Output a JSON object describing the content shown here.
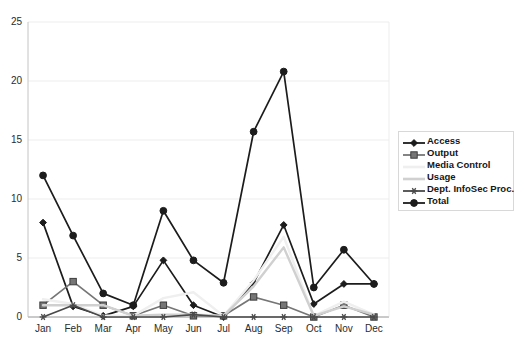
{
  "chart_data": {
    "type": "line",
    "title": "",
    "subtitle": "",
    "xlabel": "",
    "ylabel": "",
    "categories": [
      "Jan",
      "Feb",
      "Mar",
      "Apr",
      "May",
      "Jun",
      "Jul",
      "Aug",
      "Sep",
      "Oct",
      "Nov",
      "Dec"
    ],
    "ylim": [
      0,
      25
    ],
    "yticks": [
      0,
      5,
      10,
      15,
      20,
      25
    ],
    "ytick_labels": [
      "0",
      "5",
      "10",
      "15",
      "20",
      "25"
    ],
    "grid": true,
    "grid_axis": "y",
    "legend_position": "right",
    "series": [
      {
        "name": "Access",
        "color": "#1c1c1c",
        "marker": "diamond",
        "values": [
          8,
          0.9,
          0.1,
          0.9,
          4.8,
          1,
          0,
          2.9,
          7.8,
          1.1,
          2.8,
          2.8
        ]
      },
      {
        "name": "Output",
        "color": "#767676",
        "marker": "square",
        "values": [
          1,
          3,
          1,
          0.1,
          1,
          0.1,
          0.1,
          1.7,
          1,
          0,
          1,
          0
        ]
      },
      {
        "name": "Media Control",
        "color": "#efefef",
        "marker": "none",
        "values": [
          1.5,
          1.1,
          0.1,
          0.1,
          1.6,
          2.1,
          0.1,
          3.1,
          6.8,
          0.1,
          1.3,
          0.2
        ]
      },
      {
        "name": "Usage",
        "color": "#d0d0d0",
        "marker": "none",
        "values": [
          1,
          1,
          1,
          0.1,
          0.2,
          0.2,
          0.1,
          2.6,
          5.9,
          0.1,
          0.9,
          0.2
        ]
      },
      {
        "name": "Dept. InfoSec Proc.",
        "color": "#4a4a4a",
        "marker": "asterisk",
        "values": [
          0,
          1,
          0,
          0,
          0,
          0.2,
          0,
          0,
          0,
          0,
          0,
          0
        ]
      },
      {
        "name": "Total",
        "color": "#1c1c1c",
        "marker": "circle",
        "values": [
          12,
          6.9,
          2,
          1,
          9,
          4.8,
          2.9,
          15.7,
          20.8,
          2.5,
          5.7,
          2.8
        ]
      }
    ]
  },
  "legend": {
    "entries": [
      {
        "label": "Access"
      },
      {
        "label": "Output"
      },
      {
        "label": "Media Control"
      },
      {
        "label": "Usage"
      },
      {
        "label": "Dept. InfoSec Proc."
      },
      {
        "label": "Total"
      }
    ]
  }
}
